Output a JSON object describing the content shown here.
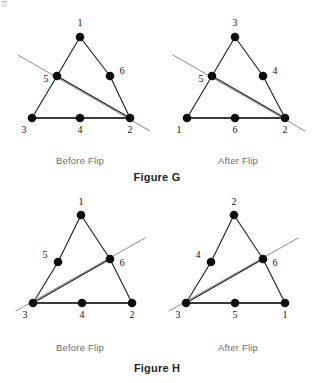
{
  "page": {
    "width": 314,
    "height": 383,
    "background": "#ffffff",
    "node_color": "#0d0d0d",
    "edge_color": "#1a1a1a",
    "base_edge_color": "#3a3a3a",
    "flip_line_color": "#8c8c8c",
    "caption_color": "#6d6d6d",
    "figure_caption_color": "#262626"
  },
  "figures": [
    {
      "name": "figure-g",
      "caption": "Figure G",
      "caption_pos": {
        "x": 157,
        "y": 171
      },
      "panels": [
        {
          "name": "figure-g-before",
          "caption": "Before Flip",
          "caption_pos": {
            "x": 80,
            "y": 155
          },
          "nodes": [
            {
              "id": "n1",
              "label": "1",
              "x": 80,
              "y": 37,
              "r": 4.3,
              "label_x": 80,
              "label_y": 26
            },
            {
              "id": "n5",
              "label": "5",
              "x": 57,
              "y": 76,
              "r": 4.3,
              "label_x": 46,
              "label_y": 82
            },
            {
              "id": "n6",
              "label": "6",
              "x": 110,
              "y": 76,
              "r": 4.3,
              "label_x": 122,
              "label_y": 74
            },
            {
              "id": "n3",
              "label": "3",
              "x": 32,
              "y": 118,
              "r": 4.3,
              "label_x": 24,
              "label_y": 133
            },
            {
              "id": "n4",
              "label": "4",
              "x": 80,
              "y": 118,
              "r": 4.3,
              "label_x": 80,
              "label_y": 133
            },
            {
              "id": "n2",
              "label": "2",
              "x": 130,
              "y": 118,
              "r": 4.3,
              "label_x": 130,
              "label_y": 133
            }
          ],
          "edges": [
            {
              "from": "n1",
              "to": "n5",
              "style": "thin"
            },
            {
              "from": "n5",
              "to": "n3",
              "style": "thin"
            },
            {
              "from": "n1",
              "to": "n6",
              "style": "thin"
            },
            {
              "from": "n6",
              "to": "n2",
              "style": "thin"
            },
            {
              "from": "n5",
              "to": "n2",
              "style": "thin"
            },
            {
              "from": "n3",
              "to": "n4",
              "style": "base"
            },
            {
              "from": "n4",
              "to": "n2",
              "style": "base"
            }
          ],
          "flip_line": {
            "x1": 18,
            "y1": 55,
            "x2": 150,
            "y2": 131
          }
        },
        {
          "name": "figure-g-after",
          "caption": "After Flip",
          "caption_pos": {
            "x": 238,
            "y": 155
          },
          "nodes": [
            {
              "id": "n3",
              "label": "3",
              "x": 235,
              "y": 37,
              "r": 4.3,
              "label_x": 235,
              "label_y": 26
            },
            {
              "id": "n5",
              "label": "5",
              "x": 212,
              "y": 76,
              "r": 4.3,
              "label_x": 201,
              "label_y": 82
            },
            {
              "id": "n4",
              "label": "4",
              "x": 263,
              "y": 76,
              "r": 4.3,
              "label_x": 275,
              "label_y": 74
            },
            {
              "id": "n1",
              "label": "1",
              "x": 187,
              "y": 118,
              "r": 4.3,
              "label_x": 179,
              "label_y": 133
            },
            {
              "id": "n6",
              "label": "6",
              "x": 235,
              "y": 118,
              "r": 4.3,
              "label_x": 235,
              "label_y": 133
            },
            {
              "id": "n2",
              "label": "2",
              "x": 285,
              "y": 118,
              "r": 4.3,
              "label_x": 285,
              "label_y": 133
            }
          ],
          "edges": [
            {
              "from": "n3",
              "to": "n5",
              "style": "thin"
            },
            {
              "from": "n5",
              "to": "n1",
              "style": "thin"
            },
            {
              "from": "n3",
              "to": "n4",
              "style": "thin"
            },
            {
              "from": "n4",
              "to": "n2",
              "style": "thin"
            },
            {
              "from": "n5",
              "to": "n2",
              "style": "thin"
            },
            {
              "from": "n1",
              "to": "n6",
              "style": "base"
            },
            {
              "from": "n6",
              "to": "n2",
              "style": "base"
            }
          ],
          "flip_line": {
            "x1": 173,
            "y1": 55,
            "x2": 305,
            "y2": 131
          }
        }
      ]
    },
    {
      "name": "figure-h",
      "caption": "Figure H",
      "caption_pos": {
        "x": 157,
        "y": 362
      },
      "panels": [
        {
          "name": "figure-h-before",
          "caption": "Before Flip",
          "caption_pos": {
            "x": 80,
            "y": 342
          },
          "nodes": [
            {
              "id": "n1",
              "label": "1",
              "x": 81,
              "y": 215,
              "r": 4.3,
              "label_x": 81,
              "label_y": 205
            },
            {
              "id": "n5",
              "label": "5",
              "x": 58,
              "y": 262,
              "r": 4.3,
              "label_x": 45,
              "label_y": 258
            },
            {
              "id": "n6",
              "label": "6",
              "x": 110,
              "y": 259,
              "r": 4.3,
              "label_x": 122,
              "label_y": 266
            },
            {
              "id": "n3",
              "label": "3",
              "x": 33,
              "y": 303,
              "r": 4.3,
              "label_x": 25,
              "label_y": 318
            },
            {
              "id": "n4",
              "label": "4",
              "x": 82,
              "y": 303,
              "r": 4.3,
              "label_x": 82,
              "label_y": 318
            },
            {
              "id": "n2",
              "label": "2",
              "x": 132,
              "y": 303,
              "r": 4.3,
              "label_x": 132,
              "label_y": 318
            }
          ],
          "edges": [
            {
              "from": "n1",
              "to": "n5",
              "style": "thin"
            },
            {
              "from": "n5",
              "to": "n3",
              "style": "thin"
            },
            {
              "from": "n1",
              "to": "n6",
              "style": "thin"
            },
            {
              "from": "n6",
              "to": "n2",
              "style": "thin"
            },
            {
              "from": "n3",
              "to": "n6",
              "style": "thin"
            },
            {
              "from": "n3",
              "to": "n4",
              "style": "base"
            },
            {
              "from": "n4",
              "to": "n2",
              "style": "base"
            }
          ],
          "flip_line": {
            "x1": 16,
            "y1": 311,
            "x2": 145,
            "y2": 238
          }
        },
        {
          "name": "figure-h-after",
          "caption": "After Flip",
          "caption_pos": {
            "x": 238,
            "y": 342
          },
          "nodes": [
            {
              "id": "n2",
              "label": "2",
              "x": 234,
              "y": 215,
              "r": 4.3,
              "label_x": 234,
              "label_y": 205
            },
            {
              "id": "n4",
              "label": "4",
              "x": 211,
              "y": 262,
              "r": 4.3,
              "label_x": 198,
              "label_y": 258
            },
            {
              "id": "n6",
              "label": "6",
              "x": 263,
              "y": 259,
              "r": 4.3,
              "label_x": 275,
              "label_y": 266
            },
            {
              "id": "n3",
              "label": "3",
              "x": 186,
              "y": 303,
              "r": 4.3,
              "label_x": 178,
              "label_y": 318
            },
            {
              "id": "n5",
              "label": "5",
              "x": 235,
              "y": 303,
              "r": 4.3,
              "label_x": 235,
              "label_y": 318
            },
            {
              "id": "n1",
              "label": "1",
              "x": 285,
              "y": 303,
              "r": 4.3,
              "label_x": 285,
              "label_y": 318
            }
          ],
          "edges": [
            {
              "from": "n2",
              "to": "n4",
              "style": "thin"
            },
            {
              "from": "n4",
              "to": "n3",
              "style": "thin"
            },
            {
              "from": "n2",
              "to": "n6",
              "style": "thin"
            },
            {
              "from": "n6",
              "to": "n1",
              "style": "thin"
            },
            {
              "from": "n3",
              "to": "n6",
              "style": "thin"
            },
            {
              "from": "n3",
              "to": "n5",
              "style": "base"
            },
            {
              "from": "n5",
              "to": "n1",
              "style": "base"
            }
          ],
          "flip_line": {
            "x1": 169,
            "y1": 311,
            "x2": 298,
            "y2": 238
          }
        }
      ]
    }
  ]
}
